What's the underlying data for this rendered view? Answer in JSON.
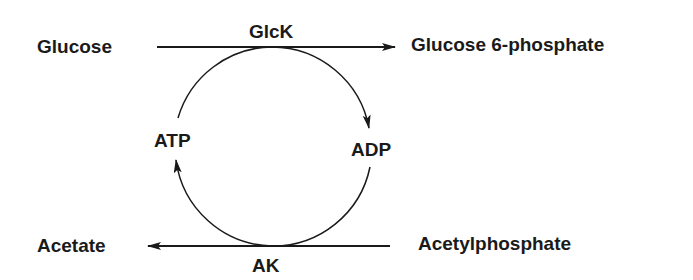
{
  "diagram": {
    "nodes": {
      "glucose": "Glucose",
      "glucose6p": "Glucose 6-phosphate",
      "acetate": "Acetate",
      "acetylphosphate": "Acetylphosphate",
      "atp": "ATP",
      "adp": "ADP"
    },
    "enzymes": {
      "top": "GlcK",
      "bottom": "AK"
    },
    "edges": [
      {
        "from": "Glucose",
        "to": "Glucose 6-phosphate",
        "enzyme": "GlcK"
      },
      {
        "from": "Acetylphosphate",
        "to": "Acetate",
        "enzyme": "AK"
      },
      {
        "from": "ATP",
        "to": "ADP",
        "via": "GlcK"
      },
      {
        "from": "ADP",
        "to": "ATP",
        "via": "AK"
      }
    ],
    "line_color": "#1a1a1a"
  }
}
